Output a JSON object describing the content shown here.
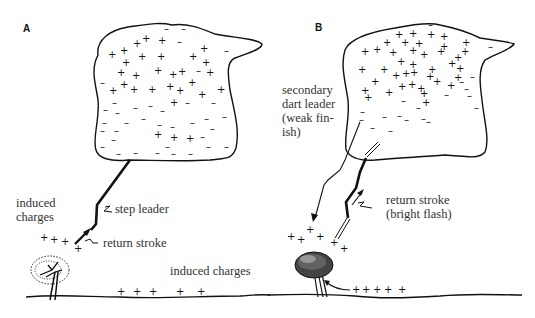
{
  "panels": [
    {
      "id": "A",
      "label": "A",
      "annotations": {
        "induced_charges_left": "induced\ncharges",
        "step_leader": "step leader",
        "return_stroke": "return stroke",
        "induced_charges_ground": "induced charges"
      },
      "ground_charges": "+  +  +   +   +",
      "tree_charges": "+ + +"
    },
    {
      "id": "B",
      "label": "B",
      "annotations": {
        "secondary_dart_leader": "secondary\ndart leader\n(weak fin-\nish)",
        "return_stroke": "return stroke\n(bright flash)"
      },
      "ground_charges": "+ + + +  +"
    }
  ],
  "colors": {
    "ink": "#111111",
    "text": "#333333",
    "background": "#ffffff"
  }
}
